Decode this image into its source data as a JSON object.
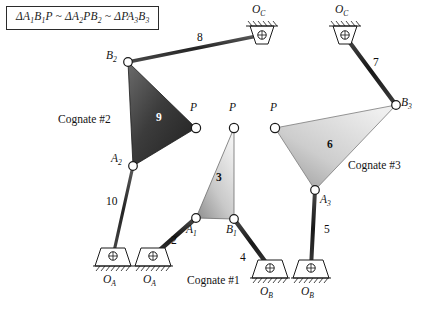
{
  "figure": {
    "title_formula": "ΔA₁B₁P ~ ΔA₂PB₂ ~ ΔPA₃B₃",
    "background": "#ffffff",
    "ink_color": "#111111"
  },
  "formula": {
    "parts": [
      {
        "t": "ΔA",
        "sub": "1"
      },
      {
        "t": "B",
        "sub": "1"
      },
      {
        "t": "P",
        "sub": ""
      }
    ],
    "full_text": "ΔA1B1P ~ ΔA2PB2 ~ ΔPA3B3"
  },
  "cognates": [
    {
      "id": "cognate-1",
      "label": "Cognate #1",
      "x": 187,
      "y": 281
    },
    {
      "id": "cognate-2",
      "label": "Cognate #2",
      "x": 58,
      "y": 120
    },
    {
      "id": "cognate-3",
      "label": "Cognate #3",
      "x": 348,
      "y": 166
    }
  ],
  "ground_pivots": [
    {
      "id": "ground-oa-left",
      "label": "O",
      "sub": "A",
      "x": 113,
      "y": 256,
      "orientation": "up",
      "label_x": 104,
      "label_y": 276
    },
    {
      "id": "ground-oa-right",
      "label": "O",
      "sub": "A",
      "x": 153,
      "y": 256,
      "orientation": "up",
      "label_x": 144,
      "label_y": 276
    },
    {
      "id": "ground-ob-left",
      "label": "O",
      "sub": "B",
      "x": 270,
      "y": 268,
      "orientation": "up",
      "label_x": 261,
      "label_y": 288
    },
    {
      "id": "ground-ob-right",
      "label": "O",
      "sub": "B",
      "x": 311,
      "y": 268,
      "orientation": "up",
      "label_x": 302,
      "label_y": 288
    },
    {
      "id": "ground-oc-left",
      "label": "O",
      "sub": "C",
      "x": 262,
      "y": 35,
      "orientation": "down",
      "label_x": 253,
      "label_y": 13
    },
    {
      "id": "ground-oc-right",
      "label": "O",
      "sub": "C",
      "x": 345,
      "y": 35,
      "orientation": "down",
      "label_x": 336,
      "label_y": 13
    }
  ],
  "joints": [
    {
      "id": "joint-a1",
      "label": "A",
      "sub": "1",
      "x": 196,
      "y": 218,
      "label_x": 186,
      "label_y": 228
    },
    {
      "id": "joint-b1",
      "label": "B",
      "sub": "1",
      "x": 234,
      "y": 219,
      "label_x": 228,
      "label_y": 228
    },
    {
      "id": "joint-p1",
      "label": "P",
      "sub": "",
      "x": 234,
      "y": 128,
      "label_x": 230,
      "label_y": 108
    },
    {
      "id": "joint-a2",
      "label": "A",
      "sub": "2",
      "x": 133,
      "y": 166,
      "label_x": 112,
      "label_y": 158
    },
    {
      "id": "joint-b2",
      "label": "B",
      "sub": "2",
      "x": 128,
      "y": 62,
      "label_x": 106,
      "label_y": 56
    },
    {
      "id": "joint-p2",
      "label": "P",
      "sub": "",
      "x": 196,
      "y": 128,
      "label_x": 192,
      "label_y": 108
    },
    {
      "id": "joint-a3",
      "label": "A",
      "sub": "3",
      "x": 315,
      "y": 190,
      "label_x": 322,
      "label_y": 200
    },
    {
      "id": "joint-b3",
      "label": "B",
      "sub": "3",
      "x": 396,
      "y": 105,
      "label_x": 403,
      "label_y": 100
    },
    {
      "id": "joint-p3",
      "label": "P",
      "sub": "",
      "x": 275,
      "y": 128,
      "label_x": 271,
      "label_y": 108
    }
  ],
  "links": [
    {
      "id": "link-2",
      "number": "2",
      "type": "bar",
      "from": "ground-oa-right",
      "to": "joint-a1",
      "label_x": 174,
      "label_y": 241
    },
    {
      "id": "link-3",
      "number": "3",
      "type": "ternary",
      "vertices": [
        "joint-a1",
        "joint-b1",
        "joint-p1"
      ],
      "shade": "light",
      "label_x": 219,
      "label_y": 178
    },
    {
      "id": "link-4",
      "number": "4",
      "type": "bar",
      "from": "joint-b1",
      "to": "ground-ob-left",
      "label_x": 243,
      "label_y": 258
    },
    {
      "id": "link-5",
      "number": "5",
      "type": "bar",
      "from": "joint-a3",
      "to": "ground-ob-right",
      "label_x": 327,
      "label_y": 230
    },
    {
      "id": "link-6",
      "number": "6",
      "type": "ternary",
      "vertices": [
        "joint-p3",
        "joint-b3",
        "joint-a3"
      ],
      "shade": "light",
      "label_x": 330,
      "label_y": 145
    },
    {
      "id": "link-7",
      "number": "7",
      "type": "bar",
      "from": "ground-oc-right",
      "to": "joint-b3",
      "label_x": 376,
      "label_y": 63
    },
    {
      "id": "link-8",
      "number": "8",
      "type": "bar",
      "from": "joint-b2",
      "to": "ground-oc-left",
      "label_x": 200,
      "label_y": 38
    },
    {
      "id": "link-9",
      "number": "9",
      "type": "ternary",
      "vertices": [
        "joint-b2",
        "joint-p2",
        "joint-a2"
      ],
      "shade": "dark",
      "label_x": 159,
      "label_y": 118
    },
    {
      "id": "link-10",
      "number": "10",
      "type": "bar",
      "from": "joint-a2",
      "to": "ground-oa-left",
      "label_x": 110,
      "label_y": 202
    }
  ],
  "colors": {
    "link_light_from": "#f4f4f4",
    "link_light_to": "#9a9a9a",
    "link_dark_from": "#5a5a5a",
    "link_dark_to": "#2a2a2a",
    "bar_dark": "#1c1c1c",
    "bar_mid": "#3a3a3a",
    "joint_fill": "#ffffff",
    "stroke": "#111111"
  }
}
